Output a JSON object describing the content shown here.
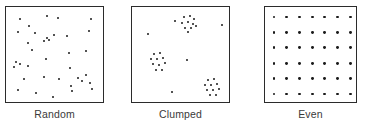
{
  "figure": {
    "background_color": "#ffffff",
    "dot_color": "#1a1a1a",
    "box_border_color": "#2b2b2b",
    "label_color": "#3a3a3a"
  },
  "panels": [
    {
      "label": "Random",
      "pattern": "random",
      "left": 5,
      "width": 99,
      "height": 97,
      "dot_count": 36,
      "dots": [
        [
          14,
          12
        ],
        [
          23,
          19
        ],
        [
          41,
          9
        ],
        [
          52,
          11
        ],
        [
          85,
          12
        ],
        [
          12,
          25
        ],
        [
          29,
          26
        ],
        [
          22,
          36
        ],
        [
          41,
          31
        ],
        [
          38,
          34
        ],
        [
          43,
          33
        ],
        [
          48,
          28
        ],
        [
          61,
          29
        ],
        [
          83,
          24
        ],
        [
          26,
          43
        ],
        [
          63,
          46
        ],
        [
          80,
          44
        ],
        [
          10,
          55
        ],
        [
          14,
          57
        ],
        [
          8,
          60
        ],
        [
          22,
          59
        ],
        [
          40,
          52
        ],
        [
          64,
          61
        ],
        [
          18,
          72
        ],
        [
          38,
          70
        ],
        [
          53,
          72
        ],
        [
          12,
          83
        ],
        [
          30,
          86
        ],
        [
          47,
          90
        ],
        [
          65,
          79
        ],
        [
          72,
          71
        ],
        [
          76,
          74
        ],
        [
          80,
          68
        ],
        [
          84,
          76
        ],
        [
          86,
          82
        ],
        [
          66,
          84
        ]
      ]
    },
    {
      "label": "Clumped",
      "pattern": "clumped",
      "left": 131,
      "width": 99,
      "height": 97,
      "dot_count": 35,
      "clusters": [
        {
          "center": [
            57,
            16
          ],
          "dots": [
            [
              52,
              10
            ],
            [
              58,
              9
            ],
            [
              62,
              12
            ],
            [
              50,
              16
            ],
            [
              56,
              15
            ],
            [
              61,
              17
            ],
            [
              53,
              21
            ],
            [
              59,
              21
            ],
            [
              64,
              19
            ],
            [
              56,
              25
            ]
          ]
        },
        {
          "center": [
            26,
            55
          ],
          "dots": [
            [
              22,
              47
            ],
            [
              28,
              46
            ],
            [
              19,
              52
            ],
            [
              25,
              52
            ],
            [
              31,
              51
            ],
            [
              21,
              57
            ],
            [
              27,
              58
            ],
            [
              33,
              56
            ],
            [
              24,
              63
            ],
            [
              30,
              63
            ]
          ]
        },
        {
          "center": [
            80,
            80
          ],
          "dots": [
            [
              76,
              73
            ],
            [
              82,
              72
            ],
            [
              73,
              78
            ],
            [
              79,
              78
            ],
            [
              85,
              77
            ],
            [
              75,
              83
            ],
            [
              81,
              83
            ],
            [
              87,
              82
            ],
            [
              78,
              88
            ],
            [
              84,
              88
            ]
          ]
        }
      ],
      "scattered_dots": [
        [
          43,
          14
        ],
        [
          16,
          27
        ],
        [
          90,
          18
        ],
        [
          55,
          53
        ],
        [
          40,
          85
        ]
      ]
    },
    {
      "label": "Even",
      "pattern": "even",
      "left": 264,
      "width": 93,
      "height": 97,
      "dot_count": 42,
      "grid": {
        "columns": 7,
        "rows": 6,
        "x_start": 9,
        "x_step": 12.7,
        "y_start": 10,
        "y_step": 15.4
      }
    }
  ]
}
